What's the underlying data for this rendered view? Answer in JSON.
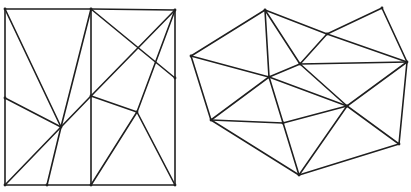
{
  "figures": [
    {
      "name": "square-triangulation",
      "description": "Triangulation inside a square with boundary and interior points",
      "points": {
        "TL": [
          5,
          9
        ],
        "TM": [
          91,
          9
        ],
        "TR": [
          175,
          10
        ],
        "LM": [
          5,
          98
        ],
        "RM": [
          175,
          78
        ],
        "BL": [
          5,
          185
        ],
        "BQ": [
          47,
          185
        ],
        "BM": [
          91,
          185
        ],
        "BR": [
          175,
          185
        ],
        "A": [
          61,
          127
        ],
        "B": [
          91,
          96
        ],
        "C": [
          137,
          112
        ]
      },
      "edges": [
        [
          "TL",
          "TM"
        ],
        [
          "TM",
          "TR"
        ],
        [
          "TR",
          "RM"
        ],
        [
          "RM",
          "BR"
        ],
        [
          "BR",
          "BM"
        ],
        [
          "BM",
          "BQ"
        ],
        [
          "BQ",
          "BL"
        ],
        [
          "BL",
          "LM"
        ],
        [
          "LM",
          "TL"
        ],
        [
          "TL",
          "A"
        ],
        [
          "TM",
          "A"
        ],
        [
          "LM",
          "A"
        ],
        [
          "BL",
          "A"
        ],
        [
          "BQ",
          "A"
        ],
        [
          "A",
          "B"
        ],
        [
          "B",
          "TR"
        ],
        [
          "TM",
          "RM"
        ],
        [
          "TM",
          "B"
        ],
        [
          "B",
          "BM"
        ],
        [
          "B",
          "C"
        ],
        [
          "C",
          "TR"
        ],
        [
          "C",
          "BM"
        ],
        [
          "C",
          "BR"
        ]
      ]
    },
    {
      "name": "polygon-triangulation",
      "description": "Triangulation of an irregular polygonal point set",
      "points": {
        "P1": [
          265,
          10
        ],
        "P2": [
          191,
          56
        ],
        "P3": [
          211,
          120
        ],
        "P4": [
          269,
          77
        ],
        "P5": [
          300,
          64
        ],
        "P6": [
          327,
          34
        ],
        "P7": [
          382,
          8
        ],
        "P8": [
          407,
          62
        ],
        "P9": [
          347,
          106
        ],
        "P10": [
          283,
          123
        ],
        "P11": [
          299,
          175
        ],
        "P12": [
          399,
          144
        ]
      },
      "edges": [
        [
          "P1",
          "P2"
        ],
        [
          "P2",
          "P3"
        ],
        [
          "P3",
          "P11"
        ],
        [
          "P11",
          "P12"
        ],
        [
          "P12",
          "P8"
        ],
        [
          "P8",
          "P7"
        ],
        [
          "P7",
          "P6"
        ],
        [
          "P1",
          "P6"
        ],
        [
          "P6",
          "P8"
        ],
        [
          "P1",
          "P4"
        ],
        [
          "P1",
          "P5"
        ],
        [
          "P2",
          "P4"
        ],
        [
          "P4",
          "P5"
        ],
        [
          "P5",
          "P6"
        ],
        [
          "P5",
          "P8"
        ],
        [
          "P5",
          "P9"
        ],
        [
          "P4",
          "P9"
        ],
        [
          "P4",
          "P3"
        ],
        [
          "P4",
          "P11"
        ],
        [
          "P3",
          "P10"
        ],
        [
          "P10",
          "P9"
        ],
        [
          "P9",
          "P8"
        ],
        [
          "P9",
          "P12"
        ],
        [
          "P9",
          "P11"
        ]
      ]
    }
  ]
}
